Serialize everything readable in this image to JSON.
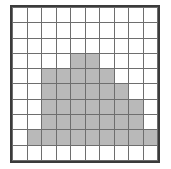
{
  "figure": {
    "rows": 10,
    "columns": 10,
    "colors": {
      "background": "#ffffff",
      "grid_line": "#6e6e6e",
      "outer_border": "#3b3b3b",
      "shaded_cell": "#b9b9b9",
      "empty_cell": "#ffffff"
    },
    "shaded_count": 40
  },
  "chart_data": {
    "type": "heatmap",
    "title": "",
    "xlabel": "",
    "ylabel": "",
    "grid": true,
    "legend": "none",
    "rows": 10,
    "columns": 10,
    "x": [
      1,
      2,
      3,
      4,
      5,
      6,
      7,
      8,
      9,
      10
    ],
    "y": [
      1,
      2,
      3,
      4,
      5,
      6,
      7,
      8,
      9,
      10
    ],
    "values": [
      [
        0,
        0,
        0,
        0,
        0,
        0,
        0,
        0,
        0,
        0
      ],
      [
        0,
        0,
        0,
        0,
        0,
        0,
        0,
        0,
        0,
        0
      ],
      [
        0,
        0,
        0,
        0,
        0,
        0,
        0,
        0,
        0,
        0
      ],
      [
        0,
        0,
        0,
        0,
        1,
        1,
        0,
        0,
        0,
        0
      ],
      [
        0,
        0,
        1,
        1,
        1,
        1,
        1,
        0,
        0,
        0
      ],
      [
        0,
        0,
        1,
        1,
        1,
        1,
        1,
        1,
        0,
        0
      ],
      [
        0,
        0,
        1,
        1,
        1,
        1,
        1,
        1,
        1,
        0
      ],
      [
        0,
        0,
        1,
        1,
        1,
        1,
        1,
        1,
        1,
        0
      ],
      [
        0,
        1,
        1,
        1,
        1,
        1,
        1,
        1,
        1,
        1
      ],
      [
        0,
        0,
        0,
        0,
        0,
        0,
        0,
        0,
        0,
        0
      ]
    ],
    "row_shaded_counts": [
      0,
      0,
      0,
      2,
      5,
      6,
      7,
      7,
      9,
      0
    ],
    "total_shaded": 40,
    "total_cells": 100
  }
}
